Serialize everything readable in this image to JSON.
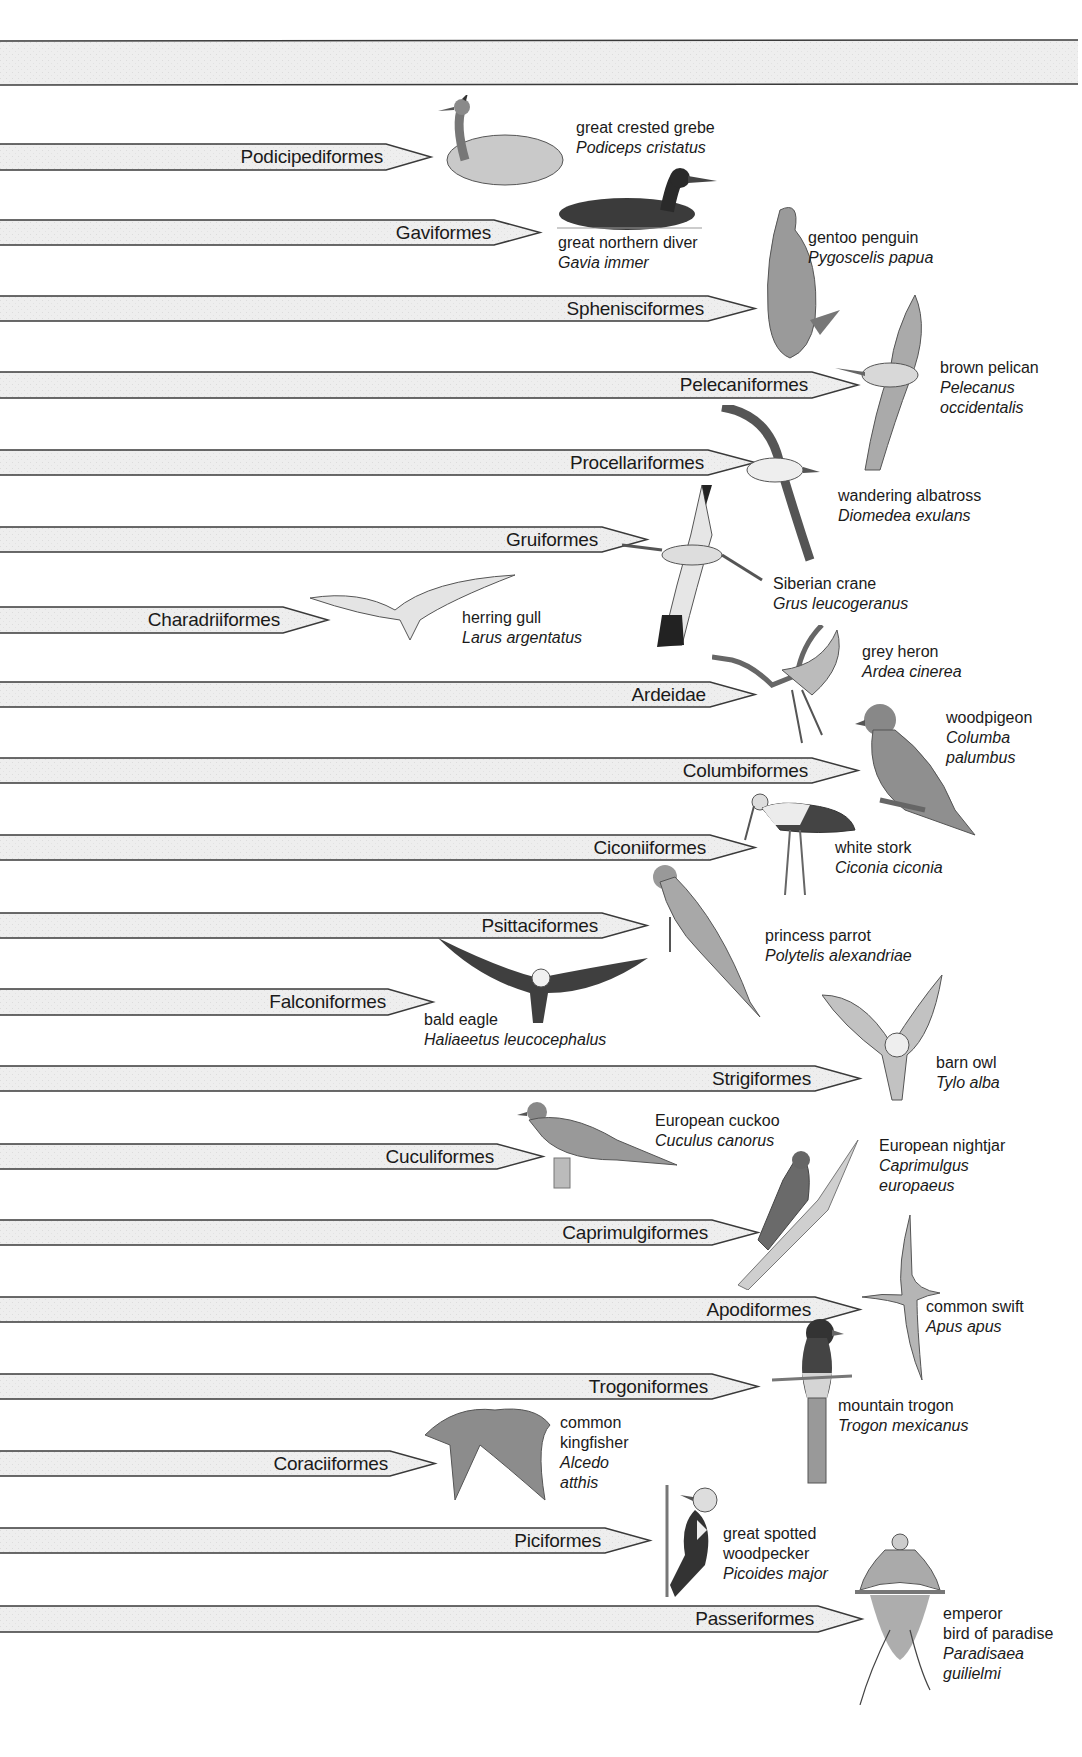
{
  "diagram": {
    "type": "phylogeny-orders-of-birds",
    "root_band": {
      "y_top": 40,
      "y_bottom": 84
    },
    "orders": [
      {
        "name": "Podicipediformes",
        "y_top": 144,
        "y_bottom": 170,
        "head_x": 386,
        "tip_x": 431
      },
      {
        "name": "Gaviformes",
        "y_top": 220,
        "y_bottom": 245,
        "head_x": 494,
        "tip_x": 540
      },
      {
        "name": "Sphenisciformes",
        "y_top": 296,
        "y_bottom": 321,
        "head_x": 708,
        "tip_x": 755
      },
      {
        "name": "Pelecaniformes",
        "y_top": 372,
        "y_bottom": 398,
        "head_x": 812,
        "tip_x": 858
      },
      {
        "name": "Procellariformes",
        "y_top": 450,
        "y_bottom": 475,
        "head_x": 708,
        "tip_x": 755
      },
      {
        "name": "Gruiformes",
        "y_top": 527,
        "y_bottom": 552,
        "head_x": 602,
        "tip_x": 647
      },
      {
        "name": "Charadriiformes",
        "y_top": 607,
        "y_bottom": 633,
        "head_x": 283,
        "tip_x": 328
      },
      {
        "name": "Ardeidae",
        "y_top": 682,
        "y_bottom": 707,
        "head_x": 710,
        "tip_x": 755
      },
      {
        "name": "Columbiformes",
        "y_top": 758,
        "y_bottom": 783,
        "head_x": 812,
        "tip_x": 858
      },
      {
        "name": "Ciconiiformes",
        "y_top": 835,
        "y_bottom": 860,
        "head_x": 710,
        "tip_x": 755
      },
      {
        "name": "Psittaciformes",
        "y_top": 913,
        "y_bottom": 938,
        "head_x": 602,
        "tip_x": 647
      },
      {
        "name": "Falconiformes",
        "y_top": 989,
        "y_bottom": 1015,
        "head_x": 388,
        "tip_x": 433
      },
      {
        "name": "Strigiformes",
        "y_top": 1066,
        "y_bottom": 1091,
        "head_x": 815,
        "tip_x": 860
      },
      {
        "name": "Cuculiformes",
        "y_top": 1144,
        "y_bottom": 1169,
        "head_x": 497,
        "tip_x": 543
      },
      {
        "name": "Caprimulgiformes",
        "y_top": 1220,
        "y_bottom": 1245,
        "head_x": 712,
        "tip_x": 758
      },
      {
        "name": "Apodiformes",
        "y_top": 1297,
        "y_bottom": 1322,
        "head_x": 815,
        "tip_x": 860
      },
      {
        "name": "Trogoniformes",
        "y_top": 1374,
        "y_bottom": 1399,
        "head_x": 712,
        "tip_x": 758
      },
      {
        "name": "Coraciiformes",
        "y_top": 1451,
        "y_bottom": 1476,
        "head_x": 390,
        "tip_x": 435
      },
      {
        "name": "Piciformes",
        "y_top": 1528,
        "y_bottom": 1553,
        "head_x": 605,
        "tip_x": 650
      },
      {
        "name": "Passeriformes",
        "y_top": 1606,
        "y_bottom": 1632,
        "head_x": 818,
        "tip_x": 862
      }
    ],
    "species": [
      {
        "common": "great crested grebe",
        "scientific": "Podiceps cristatus",
        "x": 576,
        "y": 118
      },
      {
        "common": "great northern diver",
        "scientific": "Gavia immer",
        "x": 556,
        "y": 233
      },
      {
        "common": "gentoo penguin",
        "scientific": "Pygoscelis papua",
        "x": 805,
        "y": 228
      },
      {
        "common": "brown pelican",
        "scientific": "Pelecanus occidentalis",
        "x": 935,
        "y": 356
      },
      {
        "common": "wandering albatross",
        "scientific": "Diomedea exulans",
        "x": 835,
        "y": 484
      },
      {
        "common": "Siberian crane",
        "scientific": "Grus leucogeranus",
        "x": 770,
        "y": 572
      },
      {
        "common": "herring gull",
        "scientific": "Larus argentatus",
        "x": 460,
        "y": 606
      },
      {
        "common": "grey heron",
        "scientific": "Ardea cinerea",
        "x": 858,
        "y": 640
      },
      {
        "common": "woodpigeon",
        "scientific": "Columba palumbus",
        "x": 942,
        "y": 704
      },
      {
        "common": "white stork",
        "scientific": "Ciconia ciconia",
        "x": 831,
        "y": 836
      },
      {
        "common": "princess parrot",
        "scientific": "Polytelis alexandriae",
        "x": 762,
        "y": 924
      },
      {
        "common": "bald eagle",
        "scientific": "Haliaeetus leucocephalus",
        "x": 422,
        "y": 1008
      },
      {
        "common": "barn owl",
        "scientific": "Tylo alba",
        "x": 932,
        "y": 1050
      },
      {
        "common": "European cuckoo",
        "scientific": "Cuculus canorus",
        "x": 652,
        "y": 1108
      },
      {
        "common": "European nightjar",
        "scientific": "Caprimulgus europaeus",
        "x": 876,
        "y": 1132
      },
      {
        "common": "common swift",
        "scientific": "Apus apus",
        "x": 922,
        "y": 1293
      },
      {
        "common": "mountain trogon",
        "scientific": "Trogon mexicanus",
        "x": 835,
        "y": 1393
      },
      {
        "common": "common kingfisher",
        "scientific": "Alcedo atthis",
        "x": 557,
        "y": 1409
      },
      {
        "common": "great spotted woodpecker",
        "scientific": "Picoides major",
        "x": 720,
        "y": 1520
      },
      {
        "common": "emperor bird of paradise",
        "scientific": "Paradisaea guilielmi",
        "x": 940,
        "y": 1600
      }
    ],
    "species_lines": [
      {
        "l1": "great crested grebe",
        "l2": "Podiceps cristatus"
      },
      {
        "l1": "great northern diver",
        "l2": "Gavia immer"
      },
      {
        "l1": "gentoo penguin",
        "l2": "Pygoscelis papua"
      },
      {
        "l1": "brown pelican",
        "l2": "Pelecanus",
        "l3": "occidentalis"
      },
      {
        "l1": "wandering albatross",
        "l2": "Diomedea exulans"
      },
      {
        "l1": "Siberian crane",
        "l2": "Grus leucogeranus"
      },
      {
        "l1": "herring gull",
        "l2": "Larus argentatus"
      },
      {
        "l1": "grey heron",
        "l2": "Ardea cinerea"
      },
      {
        "l1": "woodpigeon",
        "l2": "Columba",
        "l3": "palumbus"
      },
      {
        "l1": "white stork",
        "l2": "Ciconia ciconia"
      },
      {
        "l1": "princess parrot",
        "l2": "Polytelis alexandriae"
      },
      {
        "l1": "bald eagle",
        "l2": "Haliaeetus leucocephalus"
      },
      {
        "l1": "barn owl",
        "l2": "Tylo alba"
      },
      {
        "l1": "European cuckoo",
        "l2": "Cuculus canorus"
      },
      {
        "l1": "European nightjar",
        "l2": "Caprimulgus",
        "l3": "europaeus"
      },
      {
        "l1": "common swift",
        "l2": "Apus apus"
      },
      {
        "l1": "mountain trogon",
        "l2": "Trogon mexicanus"
      },
      {
        "l1": "common",
        "l1b": "kingfisher",
        "l2": "Alcedo",
        "l3": "atthis"
      },
      {
        "l1": "great spotted",
        "l1b": "woodpecker",
        "l2": "Picoides major"
      },
      {
        "l1": "emperor",
        "l1b": "bird of paradise",
        "l2": "Paradisaea",
        "l3": "guilielmi"
      }
    ]
  },
  "colors": {
    "band_fill": "#ececec",
    "band_stroke": "#3a3a3a",
    "text": "#1a1a1a",
    "background": "#ffffff"
  }
}
